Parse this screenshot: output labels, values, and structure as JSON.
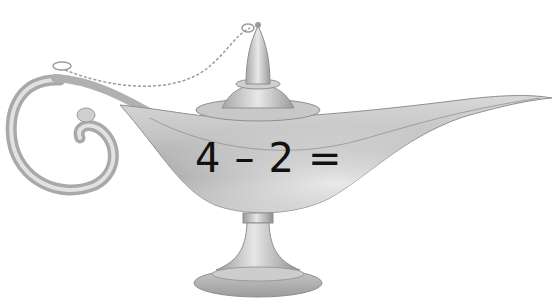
{
  "image": {
    "subject": "magic oil lamp",
    "colors": {
      "background": "#ffffff",
      "metal_light": "#e4e4e4",
      "metal_mid": "#b8b8b8",
      "metal_dark": "#8a8a8a",
      "text": "#111111"
    }
  },
  "equation": {
    "operand_a": "4",
    "operator": "–",
    "operand_b": "2",
    "equals": "="
  }
}
